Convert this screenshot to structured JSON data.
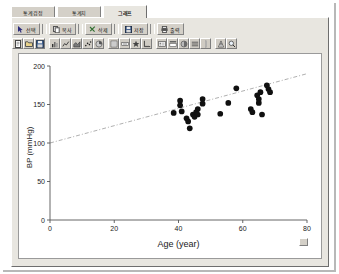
{
  "window": {
    "tabs": [
      {
        "label": "통계검정",
        "active": false,
        "name": "tab-statistical-test"
      },
      {
        "label": "통계치",
        "active": false,
        "name": "tab-statistics"
      },
      {
        "label": "그래프",
        "active": true,
        "name": "tab-graph"
      }
    ]
  },
  "toolbar": {
    "buttons": [
      {
        "label": "선택",
        "icon": "pointer-icon"
      },
      {
        "label": "복사",
        "icon": "copy-icon"
      },
      {
        "label": "삭제",
        "icon": "delete-icon"
      },
      {
        "label": "저장",
        "icon": "save-icon"
      },
      {
        "label": "출력",
        "icon": "print-icon"
      }
    ],
    "icon_groups": [
      [
        "new-doc-icon",
        "open-folder-icon",
        "save-disk-icon"
      ],
      [
        "chart-bar-icon",
        "chart-line-icon",
        "chart-area-icon",
        "chart-scatter-icon",
        "chart-pie-icon"
      ],
      [
        "grid-icon",
        "label-icon",
        "marker-icon",
        "axis-icon"
      ],
      [
        "legend-icon",
        "title-icon",
        "color-icon",
        "style-icon"
      ],
      [
        "separator-icon"
      ],
      [
        "info-icon",
        "zoom-icon"
      ]
    ]
  },
  "chart_data": {
    "type": "scatter",
    "title": "",
    "xlabel": "Age (year)",
    "ylabel": "BP (mmHg)",
    "xlim": [
      0,
      80
    ],
    "ylim": [
      0,
      200
    ],
    "xticks": [
      0,
      20,
      40,
      60,
      80
    ],
    "yticks": [
      0,
      50,
      100,
      150,
      200
    ],
    "grid": false,
    "legend": "none",
    "marker": {
      "shape": "circle",
      "color": "#101010",
      "size": 4
    },
    "points": [
      {
        "x": 40.5,
        "y": 155
      },
      {
        "x": 40.5,
        "y": 149
      },
      {
        "x": 41.0,
        "y": 141
      },
      {
        "x": 42.5,
        "y": 132
      },
      {
        "x": 43.0,
        "y": 128
      },
      {
        "x": 44.5,
        "y": 137
      },
      {
        "x": 45.0,
        "y": 134
      },
      {
        "x": 45.5,
        "y": 140
      },
      {
        "x": 46.0,
        "y": 144
      },
      {
        "x": 46.0,
        "y": 137
      },
      {
        "x": 47.5,
        "y": 157
      },
      {
        "x": 47.5,
        "y": 151
      },
      {
        "x": 38.5,
        "y": 139
      },
      {
        "x": 43.5,
        "y": 119
      },
      {
        "x": 53.0,
        "y": 138
      },
      {
        "x": 55.5,
        "y": 152
      },
      {
        "x": 58.0,
        "y": 171
      },
      {
        "x": 62.5,
        "y": 144
      },
      {
        "x": 63.0,
        "y": 140
      },
      {
        "x": 64.5,
        "y": 162
      },
      {
        "x": 65.0,
        "y": 157
      },
      {
        "x": 65.0,
        "y": 152
      },
      {
        "x": 65.5,
        "y": 166
      },
      {
        "x": 66.0,
        "y": 137
      },
      {
        "x": 67.5,
        "y": 175
      },
      {
        "x": 68.0,
        "y": 170
      },
      {
        "x": 68.5,
        "y": 166
      }
    ],
    "trendline": {
      "type": "linear",
      "style": "dash-dot",
      "color": "#b0b0b0",
      "x_start": 0,
      "y_start": 100,
      "x_end": 80,
      "y_end": 190
    }
  }
}
